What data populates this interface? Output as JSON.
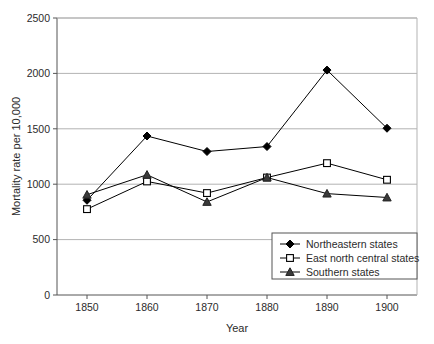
{
  "chart_data": {
    "type": "line",
    "title": "",
    "xlabel": "Year",
    "ylabel": "Mortality rate per 10,000",
    "categories": [
      1850,
      1860,
      1870,
      1880,
      1890,
      1900
    ],
    "x_tick_labels": [
      "1850",
      "1860",
      "1870",
      "1880",
      "1890",
      "1900"
    ],
    "y_tick_labels": [
      "0",
      "500",
      "1000",
      "1500",
      "2000",
      "2500"
    ],
    "y_ticks": [
      0,
      500,
      1000,
      1500,
      2000,
      2500
    ],
    "ylim": [
      0,
      2500
    ],
    "xlim": [
      1845,
      1905
    ],
    "grid": "horizontal",
    "legend_position": "lower-right",
    "series": [
      {
        "name": "Northeastern states",
        "marker": "filled-diamond",
        "color": "#000000",
        "values": [
          855,
          1435,
          1295,
          1340,
          2030,
          1505
        ]
      },
      {
        "name": "East north central states",
        "marker": "open-square",
        "color": "#000000",
        "values": [
          775,
          1025,
          920,
          1060,
          1190,
          1040
        ]
      },
      {
        "name": "Southern states",
        "marker": "filled-triangle",
        "color": "#000000",
        "values": [
          905,
          1085,
          840,
          1060,
          915,
          880
        ]
      }
    ]
  },
  "legend": {
    "entries": [
      {
        "label": "Northeastern states",
        "marker": "filled-diamond"
      },
      {
        "label": "East north central states",
        "marker": "open-square"
      },
      {
        "label": "Southern states",
        "marker": "filled-triangle"
      }
    ]
  },
  "colors": {
    "axis": "#555555",
    "grid": "#b3b3b3",
    "series": "#000000",
    "background": "#ffffff",
    "legend_border": "#555555"
  }
}
